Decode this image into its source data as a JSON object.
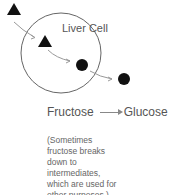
{
  "diagram": {
    "cell_label": "Liver Cell",
    "equation": {
      "from": "Fructose",
      "to": "Glucose"
    },
    "note_lines": [
      "(Sometimes",
      "fructose breaks",
      "down to",
      "intermediates,",
      "which are used for",
      "other purposes.)"
    ],
    "colors": {
      "shape": "#111111",
      "circle": "#666666",
      "arrow": "#999999"
    }
  }
}
